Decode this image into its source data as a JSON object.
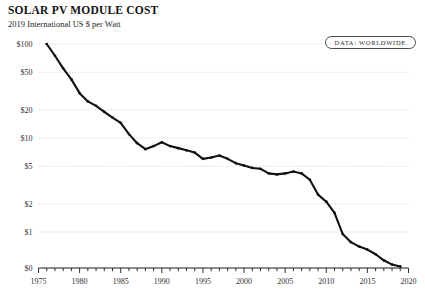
{
  "header": {
    "title": "SOLAR PV MODULE COST",
    "subtitle": "2019 International US $ per Watt",
    "badge": "DATA: WORLDWIDE"
  },
  "chart_data": {
    "type": "line",
    "title": "SOLAR PV MODULE COST",
    "subtitle": "2019 International US $ per Watt",
    "xlabel": "",
    "ylabel": "2019 International US $ per Watt",
    "yscale": "log",
    "ylim": [
      0.3,
      120
    ],
    "xlim": [
      1975,
      2020
    ],
    "grid": true,
    "legend": false,
    "annotations": [
      "DATA: WORLDWIDE"
    ],
    "ytick_labels": [
      "$100",
      "$50",
      "$20",
      "$10",
      "$5",
      "$2",
      "$1",
      "$0"
    ],
    "ytick_values": [
      100,
      50,
      20,
      10,
      5,
      2,
      1,
      0.35
    ],
    "xtick_labels": [
      "1975",
      "1980",
      "1985",
      "1990",
      "1995",
      "2000",
      "2005",
      "2010",
      "2015",
      "2020"
    ],
    "xtick_values": [
      1975,
      1980,
      1985,
      1990,
      1995,
      2000,
      2005,
      2010,
      2015,
      2020
    ],
    "xminor_step": 1,
    "series": [
      {
        "name": "Solar PV module cost",
        "x": [
          1976,
          1977,
          1978,
          1979,
          1980,
          1981,
          1982,
          1983,
          1984,
          1985,
          1986,
          1987,
          1988,
          1989,
          1990,
          1991,
          1992,
          1993,
          1994,
          1995,
          1996,
          1997,
          1998,
          1999,
          2000,
          2001,
          2002,
          2003,
          2004,
          2005,
          2006,
          2007,
          2008,
          2009,
          2010,
          2011,
          2012,
          2013,
          2014,
          2015,
          2016,
          2017,
          2018,
          2019
        ],
        "values": [
          100.0,
          75.0,
          55.0,
          42.0,
          30.0,
          24.5,
          22.0,
          19.0,
          16.5,
          14.5,
          11.0,
          8.8,
          7.6,
          8.2,
          9.0,
          8.2,
          7.8,
          7.4,
          7.0,
          6.0,
          6.2,
          6.5,
          6.0,
          5.4,
          5.1,
          4.8,
          4.7,
          4.2,
          4.1,
          4.2,
          4.4,
          4.2,
          3.6,
          2.5,
          2.1,
          1.6,
          0.95,
          0.78,
          0.7,
          0.65,
          0.58,
          0.5,
          0.45,
          0.43
        ]
      }
    ]
  }
}
